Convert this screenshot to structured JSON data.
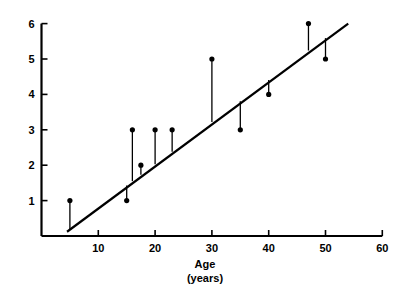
{
  "chart_data": {
    "type": "scatter",
    "title": "",
    "subtitle": "",
    "xlabel": "Age",
    "xlabel_units": "(years)",
    "ylabel": "",
    "xlim": [
      0,
      60
    ],
    "ylim": [
      0,
      6
    ],
    "grid": false,
    "legend": null,
    "x_ticks": [
      10,
      20,
      30,
      40,
      50,
      60
    ],
    "x_tick_labels": [
      "10",
      "20",
      "30",
      "40",
      "50",
      "60"
    ],
    "y_ticks": [
      1,
      2,
      3,
      4,
      5,
      6
    ],
    "y_tick_labels": [
      "1",
      "2",
      "3",
      "4",
      "5",
      "6"
    ],
    "series": [
      {
        "name": "observations",
        "marker": "filled-circle",
        "x": [
          5,
          15,
          16,
          17.5,
          20,
          23,
          30,
          35,
          40,
          47,
          50
        ],
        "y": [
          1,
          1,
          3,
          2,
          3,
          3,
          5,
          3,
          4,
          6,
          5
        ]
      }
    ],
    "fit_line": {
      "name": "regression line",
      "x": [
        4.5,
        54
      ],
      "y": [
        0.12,
        6.0
      ]
    },
    "residual_stems": {
      "name": "residual segments",
      "description": "vertical segments from each point to the regression line",
      "points": [
        {
          "x": 5,
          "y": 1,
          "line_y": 0.18
        },
        {
          "x": 15,
          "y": 1,
          "line_y": 1.43
        },
        {
          "x": 16,
          "y": 3,
          "line_y": 1.55
        },
        {
          "x": 17.5,
          "y": 2,
          "line_y": 1.73
        },
        {
          "x": 20,
          "y": 3,
          "line_y": 2.03
        },
        {
          "x": 23,
          "y": 3,
          "line_y": 2.38
        },
        {
          "x": 30,
          "y": 5,
          "line_y": 3.22
        },
        {
          "x": 35,
          "y": 3,
          "line_y": 3.81
        },
        {
          "x": 40,
          "y": 4,
          "line_y": 4.41
        },
        {
          "x": 47,
          "y": 6,
          "line_y": 5.24
        },
        {
          "x": 50,
          "y": 5,
          "line_y": 5.59
        }
      ]
    },
    "colors": {
      "axis": "#000000",
      "marker": "#000000",
      "fit_line": "#000000",
      "stem": "#000000",
      "background": "#ffffff"
    }
  },
  "axis": {
    "x_caption_line1": "Age",
    "x_caption_line2": "(years)"
  }
}
